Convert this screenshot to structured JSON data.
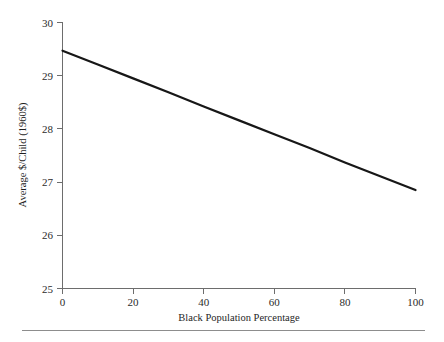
{
  "chart_data": {
    "type": "line",
    "title": "",
    "subtitle": "",
    "xlabel": "Black Population Percentage",
    "ylabel": "Average $/Child (1960$)",
    "xlim": [
      0,
      100
    ],
    "ylim": [
      25,
      30
    ],
    "xticks": [
      0,
      20,
      40,
      60,
      80,
      100
    ],
    "xtick_labels": [
      "0",
      "20",
      "40",
      "60",
      "80",
      "100"
    ],
    "yticks": [
      25,
      26,
      27,
      28,
      29,
      30
    ],
    "ytick_labels": [
      "25",
      "26",
      "27",
      "28",
      "29",
      "30"
    ],
    "grid": false,
    "legend": false,
    "legend_position": "none",
    "annotations": [],
    "series": [
      {
        "name": "Average $/Child vs Black Population Percentage",
        "type": "line",
        "color": "#171717",
        "x": [
          0,
          10,
          20,
          30,
          40,
          50,
          60,
          70,
          80,
          90,
          100
        ],
        "values": [
          29.47,
          29.21,
          28.95,
          28.69,
          28.42,
          28.16,
          27.9,
          27.64,
          27.37,
          27.11,
          26.85
        ]
      }
    ]
  },
  "figure": {
    "background_color": "#ffffff",
    "axis_color": "#6d6d6d",
    "line_color": "#171717",
    "text_color": "#1f1f1f",
    "footer_rule_color": "#8d8d8d"
  }
}
